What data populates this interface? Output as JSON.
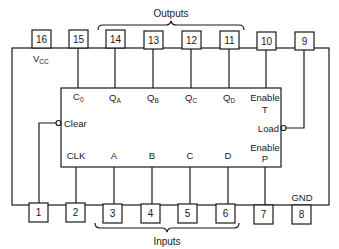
{
  "diagram": {
    "groups": {
      "outputs_label": "Outputs",
      "inputs_label": "Inputs"
    },
    "top_pins": [
      {
        "num": "16",
        "label": "V",
        "sub": "CC",
        "kind": "power"
      },
      {
        "num": "15",
        "label": "C",
        "sub": "0",
        "kind": "signal"
      },
      {
        "num": "14",
        "label": "Q",
        "sub": "A",
        "kind": "signal"
      },
      {
        "num": "13",
        "label": "Q",
        "sub": "B",
        "kind": "signal"
      },
      {
        "num": "12",
        "label": "Q",
        "sub": "C",
        "kind": "signal"
      },
      {
        "num": "11",
        "label": "Q",
        "sub": "D",
        "kind": "signal"
      },
      {
        "num": "10",
        "label": "Enable",
        "label2": "T",
        "kind": "signal"
      },
      {
        "num": "9",
        "label": "Load",
        "kind": "side-right"
      }
    ],
    "bottom_pins": [
      {
        "num": "1",
        "label": "Clear",
        "kind": "side-left"
      },
      {
        "num": "2",
        "label": "CLK",
        "kind": "signal"
      },
      {
        "num": "3",
        "label": "A",
        "kind": "signal"
      },
      {
        "num": "4",
        "label": "B",
        "kind": "signal"
      },
      {
        "num": "5",
        "label": "C",
        "kind": "signal"
      },
      {
        "num": "6",
        "label": "D",
        "kind": "signal"
      },
      {
        "num": "7",
        "label": "Enable",
        "label2": "P",
        "kind": "signal"
      },
      {
        "num": "8",
        "label": "GND",
        "kind": "power"
      }
    ]
  }
}
